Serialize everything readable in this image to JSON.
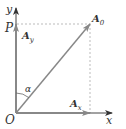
{
  "diagram": {
    "colors": {
      "axis": "#444444",
      "vector": "#888888",
      "dashed": "#aaaaaa",
      "text": "#333333"
    },
    "labels": {
      "origin": "O",
      "x_axis": "x",
      "y_axis": "y",
      "point_p": "P",
      "vector_main": "A",
      "vector_main_sub": "0",
      "component_x": "A",
      "component_x_sub": "x",
      "component_y": "A",
      "component_y_sub": "y",
      "angle": "α"
    }
  }
}
